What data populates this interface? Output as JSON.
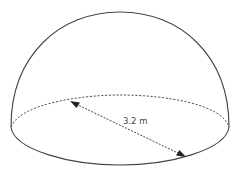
{
  "diagram": {
    "shape": "hemisphere",
    "dimension_label": "3.2 m",
    "dimension_type": "diameter",
    "colors": {
      "outline": "#444444",
      "dashed": "#555555",
      "arrow": "#222222",
      "background": "#ffffff"
    }
  }
}
